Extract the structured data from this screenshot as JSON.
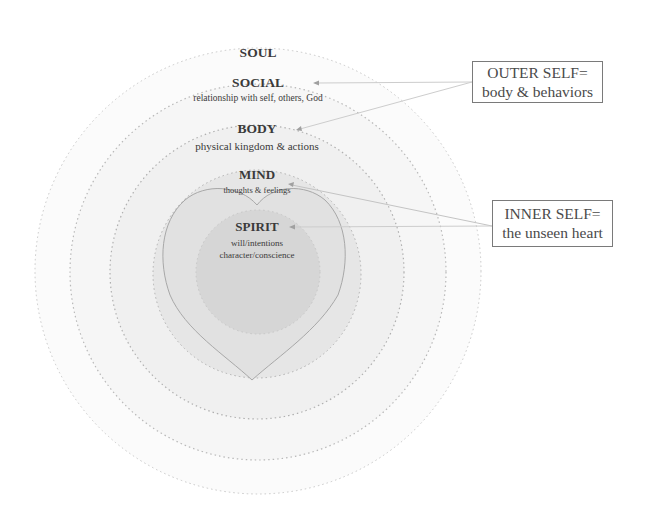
{
  "diagram": {
    "rings": [
      {
        "id": "soul",
        "title": "SOUL",
        "subtitle": ""
      },
      {
        "id": "social",
        "title": "SOCIAL",
        "subtitle": "relationship  with self, others, God"
      },
      {
        "id": "body",
        "title": "BODY",
        "subtitle": "physical kingdom & actions"
      },
      {
        "id": "mind",
        "title": "MIND",
        "subtitle": "thoughts  & feelings"
      },
      {
        "id": "spirit",
        "title": "SPIRIT",
        "subtitle_lines": [
          "will/intentions",
          "character/conscience"
        ]
      }
    ],
    "callouts": {
      "outer": {
        "line1": "OUTER SELF=",
        "line2": "body & behaviors",
        "points_to": [
          "social",
          "body"
        ]
      },
      "inner": {
        "line1": "INNER SELF=",
        "line2": "the unseen heart",
        "points_to": [
          "mind",
          "spirit"
        ]
      }
    },
    "colors": {
      "soul_fill": "#fbfbfb",
      "social_fill": "#f6f6f6",
      "body_fill": "#f0f0f0",
      "mind_fill": "#e5e5e5",
      "heart_fill": "#e0e0e0",
      "spirit_fill": "#d5d5d5",
      "dotted_stroke": "#b8b8b8",
      "connector": "#c8c8c8"
    }
  }
}
